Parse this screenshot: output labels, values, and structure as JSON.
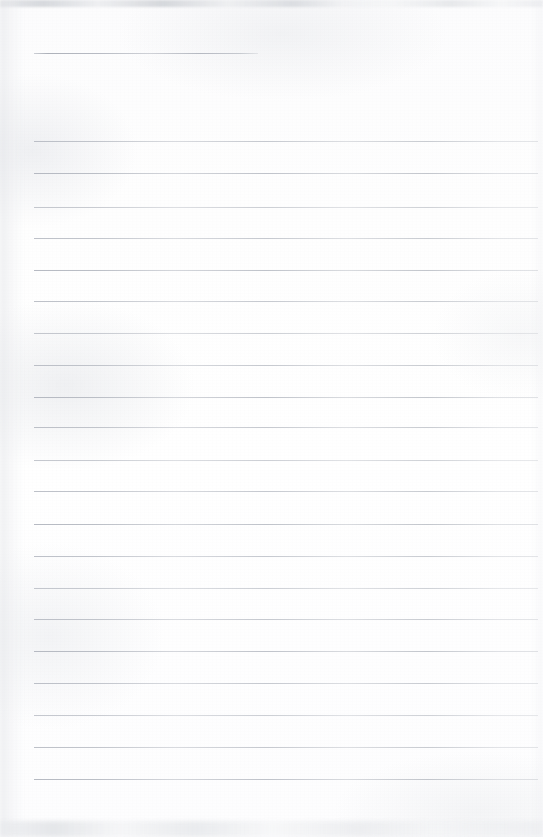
{
  "document": {
    "kind": "scanned-ruled-notebook-page",
    "title_text": "",
    "body_text": "",
    "is_blank": "true",
    "page_width": 543,
    "page_height": 837
  },
  "palette": {
    "paper": "#fdfdfd",
    "rule": "#b9bdc5",
    "rule_dark": "#aaaeb7",
    "rule_light": "#c7cad0",
    "edge_shadow": "#d6d8dc"
  },
  "ruling": {
    "left_margin_x": 34,
    "right_edge_x": 538,
    "short_rule": {
      "x": 34,
      "y": 53,
      "width": 224
    },
    "line_spacing": 31.6,
    "line_count": 21,
    "lines": [
      {
        "y": 141,
        "x": 34,
        "width": 504,
        "tone": "r-mid"
      },
      {
        "y": 173,
        "x": 34,
        "width": 504,
        "tone": "r-dark"
      },
      {
        "y": 207,
        "x": 34,
        "width": 504,
        "tone": "r-light"
      },
      {
        "y": 238,
        "x": 34,
        "width": 504,
        "tone": "r-mid"
      },
      {
        "y": 270,
        "x": 34,
        "width": 504,
        "tone": "r-dark"
      },
      {
        "y": 301,
        "x": 34,
        "width": 504,
        "tone": "r-mid"
      },
      {
        "y": 333,
        "x": 34,
        "width": 504,
        "tone": "r-light"
      },
      {
        "y": 365,
        "x": 34,
        "width": 504,
        "tone": "r-mid"
      },
      {
        "y": 397,
        "x": 34,
        "width": 504,
        "tone": "r-dark"
      },
      {
        "y": 427,
        "x": 34,
        "width": 504,
        "tone": "r-mid"
      },
      {
        "y": 460,
        "x": 34,
        "width": 504,
        "tone": "r-light"
      },
      {
        "y": 491,
        "x": 34,
        "width": 504,
        "tone": "r-mid"
      },
      {
        "y": 524,
        "x": 34,
        "width": 504,
        "tone": "r-dark"
      },
      {
        "y": 556,
        "x": 34,
        "width": 504,
        "tone": "r-mid"
      },
      {
        "y": 588,
        "x": 34,
        "width": 504,
        "tone": "r-light"
      },
      {
        "y": 619,
        "x": 34,
        "width": 504,
        "tone": "r-mid"
      },
      {
        "y": 651,
        "x": 34,
        "width": 504,
        "tone": "r-dark"
      },
      {
        "y": 683,
        "x": 34,
        "width": 504,
        "tone": "r-mid"
      },
      {
        "y": 715,
        "x": 34,
        "width": 504,
        "tone": "r-light"
      },
      {
        "y": 747,
        "x": 34,
        "width": 504,
        "tone": "r-mid"
      },
      {
        "y": 779,
        "x": 34,
        "width": 504,
        "tone": "r-dark"
      }
    ]
  }
}
